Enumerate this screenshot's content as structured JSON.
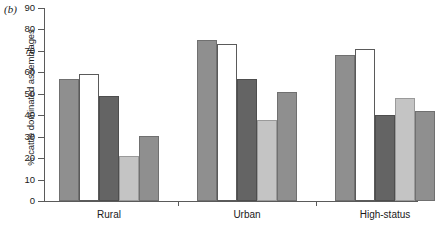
{
  "panel": {
    "label": "(b)"
  },
  "chart_data": {
    "type": "bar",
    "title": "",
    "subtitle": "",
    "xlabel": "",
    "ylabel": "% cattle dominated assemblages",
    "ylim": [
      0,
      90
    ],
    "ytick_step": 10,
    "yticks": [
      0,
      10,
      20,
      30,
      40,
      50,
      60,
      70,
      80,
      90
    ],
    "ytick_labels": [
      "0",
      "10",
      "20",
      "30",
      "40",
      "50",
      "60",
      "70",
      "80",
      "90"
    ],
    "grid": false,
    "legend": "none",
    "categories": [
      "Rural",
      "Urban",
      "High-status"
    ],
    "series": [
      {
        "name": "series-1",
        "shade": "mid",
        "color": "#8f8f8f",
        "values": [
          57,
          75,
          68
        ]
      },
      {
        "name": "series-2",
        "shade": "white",
        "color": "#ffffff",
        "values": [
          59,
          73,
          71
        ]
      },
      {
        "name": "series-3",
        "shade": "dark",
        "color": "#646464",
        "values": [
          49,
          57,
          40
        ]
      },
      {
        "name": "series-4",
        "shade": "light",
        "color": "#c4c4c4",
        "values": [
          21,
          38,
          48
        ]
      },
      {
        "name": "series-5",
        "shade": "mid",
        "color": "#8f8f8f",
        "values": [
          30.5,
          51,
          42
        ]
      }
    ]
  },
  "axis": {
    "axis_color": "#5a5a5a"
  }
}
